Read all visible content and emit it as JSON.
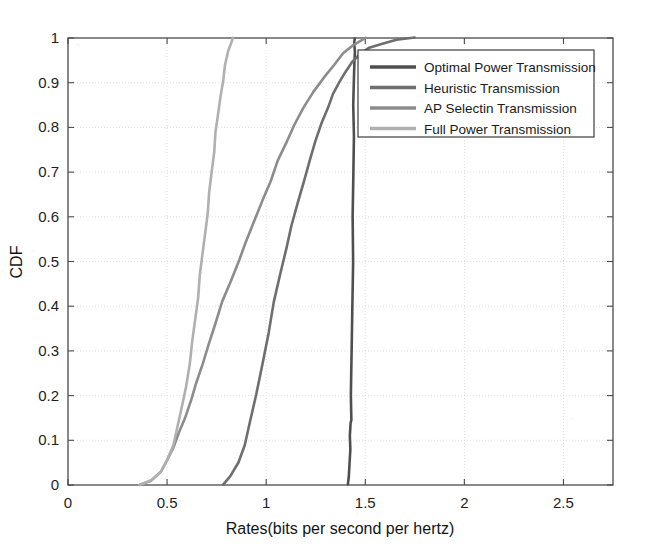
{
  "figure": {
    "name": "cdf-rates-plot",
    "background_color": "#ffffff",
    "axis_color": "#4a4a4a",
    "grid_color": "#d8d8d8"
  },
  "axes": {
    "x_label": "Rates(bits per second per hertz)",
    "y_label": "CDF",
    "x_ticks": [
      "0",
      "0.5",
      "1",
      "1.5",
      "2",
      "2.5"
    ],
    "x_tick_values": [
      0,
      0.5,
      1,
      1.5,
      2,
      2.5
    ],
    "y_ticks": [
      "0",
      "0.1",
      "0.2",
      "0.3",
      "0.4",
      "0.5",
      "0.6",
      "0.7",
      "0.8",
      "0.9",
      "1"
    ],
    "y_tick_values": [
      0,
      0.1,
      0.2,
      0.3,
      0.4,
      0.5,
      0.6,
      0.7,
      0.8,
      0.9,
      1
    ],
    "xlim": [
      0,
      2.75
    ],
    "ylim": [
      0,
      1
    ]
  },
  "legend": {
    "position": "top-right-inside",
    "items": [
      {
        "label": "Optimal Power Transmission",
        "color": "#4f4f4f"
      },
      {
        "label": "Heuristic Transmission",
        "color": "#6e6e6e"
      },
      {
        "label": "AP Selectin Transmission",
        "color": "#8c8c8c"
      },
      {
        "label": "Full Power Transmission",
        "color": "#b0b0b0"
      }
    ]
  },
  "chart_data": {
    "type": "line",
    "title": "",
    "xlabel": "Rates(bits per second per hertz)",
    "ylabel": "CDF",
    "xlim": [
      0,
      2.75
    ],
    "ylim": [
      0,
      1
    ],
    "grid": true,
    "legend_position": "upper right",
    "series": [
      {
        "name": "Optimal Power Transmission",
        "color": "#4f4f4f",
        "x": [
          1.415,
          1.418,
          1.42,
          1.422,
          1.424,
          1.426,
          1.428,
          1.43,
          1.432,
          1.434,
          1.436,
          1.438,
          1.44,
          1.441,
          1.442,
          1.443,
          1.444,
          1.445,
          1.446,
          1.447
        ],
        "y": [
          0.0,
          0.02,
          0.05,
          0.08,
          0.11,
          0.14,
          0.145,
          0.2,
          0.3,
          0.4,
          0.5,
          0.6,
          0.7,
          0.78,
          0.85,
          0.9,
          0.94,
          0.97,
          0.99,
          1.0
        ]
      },
      {
        "name": "Heuristic Transmission",
        "color": "#6e6e6e",
        "x": [
          0.78,
          0.82,
          0.86,
          0.89,
          0.92,
          0.95,
          0.98,
          1.01,
          1.04,
          1.07,
          1.1,
          1.13,
          1.16,
          1.19,
          1.22,
          1.25,
          1.28,
          1.31,
          1.34,
          1.37,
          1.4,
          1.43,
          1.47,
          1.52,
          1.58,
          1.66,
          1.75
        ],
        "y": [
          0.0,
          0.02,
          0.05,
          0.09,
          0.14,
          0.2,
          0.27,
          0.34,
          0.41,
          0.47,
          0.53,
          0.58,
          0.63,
          0.68,
          0.73,
          0.77,
          0.81,
          0.845,
          0.875,
          0.9,
          0.925,
          0.945,
          0.963,
          0.978,
          0.988,
          0.996,
          1.0
        ]
      },
      {
        "name": "AP Selectin Transmission",
        "color": "#8c8c8c",
        "x": [
          0.36,
          0.42,
          0.47,
          0.5,
          0.53,
          0.56,
          0.59,
          0.62,
          0.65,
          0.68,
          0.71,
          0.74,
          0.78,
          0.82,
          0.86,
          0.9,
          0.94,
          0.98,
          1.02,
          1.06,
          1.1,
          1.14,
          1.19,
          1.24,
          1.29,
          1.34,
          1.39,
          1.44,
          1.5
        ],
        "y": [
          0.0,
          0.01,
          0.03,
          0.055,
          0.085,
          0.115,
          0.15,
          0.19,
          0.23,
          0.27,
          0.315,
          0.36,
          0.41,
          0.455,
          0.5,
          0.545,
          0.59,
          0.635,
          0.68,
          0.725,
          0.765,
          0.805,
          0.845,
          0.88,
          0.91,
          0.94,
          0.965,
          0.985,
          1.0
        ]
      },
      {
        "name": "Full Power Transmission",
        "color": "#b0b0b0",
        "x": [
          0.36,
          0.42,
          0.47,
          0.5,
          0.53,
          0.555,
          0.575,
          0.595,
          0.612,
          0.628,
          0.642,
          0.655,
          0.668,
          0.68,
          0.692,
          0.703,
          0.714,
          0.725,
          0.736,
          0.747,
          0.758,
          0.769,
          0.781,
          0.794,
          0.808,
          0.822,
          0.835
        ],
        "y": [
          0.0,
          0.01,
          0.03,
          0.055,
          0.09,
          0.13,
          0.175,
          0.22,
          0.27,
          0.32,
          0.37,
          0.42,
          0.47,
          0.52,
          0.565,
          0.61,
          0.655,
          0.7,
          0.745,
          0.79,
          0.83,
          0.87,
          0.905,
          0.94,
          0.97,
          0.99,
          1.0
        ]
      }
    ]
  }
}
